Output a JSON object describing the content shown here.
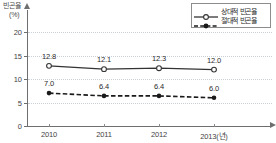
{
  "chart_data": {
    "type": "line",
    "title": "",
    "xlabel": "2013(년)",
    "ylabel": "빈곤율",
    "yunit": "(%)",
    "categories": [
      "2010",
      "2011",
      "2012",
      "2013(년)"
    ],
    "x_positions_px": [
      22,
      77,
      132,
      187
    ],
    "ylim": [
      0,
      20
    ],
    "yticks": [
      0,
      5,
      10,
      15,
      20
    ],
    "ytick_labels": [
      "0",
      "5",
      "10",
      "15",
      "20"
    ],
    "grid": true,
    "grid_axis": "y",
    "legend_position": "top-right",
    "series": [
      {
        "name": "상대적 빈곤율",
        "values": [
          12.8,
          12.1,
          12.3,
          12.0
        ],
        "labels": [
          "12.8",
          "12.1",
          "12.3",
          "12.0"
        ],
        "marker": "open-circle",
        "linestyle": "solid",
        "color": "#333333"
      },
      {
        "name": "절대적 빈곤율",
        "values": [
          7.0,
          6.4,
          6.4,
          6.0
        ],
        "labels": [
          "7.0",
          "6.4",
          "6.4",
          "6.0"
        ],
        "marker": "filled-circle",
        "linestyle": "dashed",
        "color": "#1a1a1a"
      }
    ]
  },
  "legend": {
    "entries": [
      {
        "label": "상대적 빈곤율"
      },
      {
        "label": "절대적 빈곤율"
      }
    ]
  },
  "colors": {
    "axis": "#6e6e6e",
    "grid": "#c9cfd6",
    "series_relative": "#333333",
    "series_absolute": "#1a1a1a",
    "text": "#2b2b2b",
    "background": "#ffffff"
  }
}
